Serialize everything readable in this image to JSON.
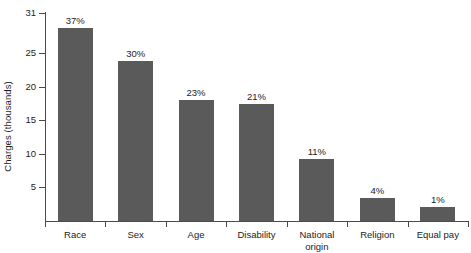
{
  "chart_data": {
    "type": "bar",
    "title": "",
    "subtitle": "",
    "xlabel": "",
    "ylabel": "Charges (thousands)",
    "categories": [
      "Race",
      "Sex",
      "Age",
      "Disability",
      "National\norigin",
      "Religion",
      "Equal pay"
    ],
    "values": [
      28.8,
      23.8,
      18.0,
      17.5,
      9.2,
      3.4,
      2.1
    ],
    "data_labels": [
      "37%",
      "30%",
      "23%",
      "21%",
      "11%",
      "4%",
      "1%"
    ],
    "ylim": [
      0,
      31
    ],
    "yticks": [
      5,
      10,
      15,
      20,
      25,
      31
    ],
    "ytick_labels": [
      "5",
      "10",
      "15",
      "20",
      "25",
      "31"
    ],
    "grid": false,
    "legend": false,
    "legend_position": "none",
    "bar_color": "#5a5a5a",
    "axis_color": "#4a4a4a",
    "text_color": "#1c1c1c",
    "background_color": "#ffffff"
  }
}
